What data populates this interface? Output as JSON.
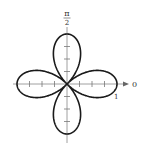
{
  "chart_data": {
    "type": "line",
    "subtype": "polar-rose",
    "title": "",
    "equation": "r = cos(2θ)",
    "petals": 4,
    "max_r": 1,
    "polar_axis_label": "0",
    "vertical_axis_label_num": "π",
    "vertical_axis_label_den": "2",
    "radius_tick_label": "1",
    "tick_spacing": 0.25,
    "ticks_per_half_axis": 3,
    "grid": false,
    "colors": {
      "curve": "#1a1a1a",
      "axis": "#777777",
      "label": "#333333"
    },
    "points_sample": [
      {
        "theta_deg": 0,
        "r": 1
      },
      {
        "theta_deg": 22.5,
        "r": 0.707
      },
      {
        "theta_deg": 45,
        "r": 0
      },
      {
        "theta_deg": 67.5,
        "r": -0.707
      },
      {
        "theta_deg": 90,
        "r": -1
      },
      {
        "theta_deg": 135,
        "r": 0
      },
      {
        "theta_deg": 180,
        "r": 1
      },
      {
        "theta_deg": 225,
        "r": 0
      },
      {
        "theta_deg": 270,
        "r": -1
      },
      {
        "theta_deg": 315,
        "r": 0
      }
    ]
  }
}
